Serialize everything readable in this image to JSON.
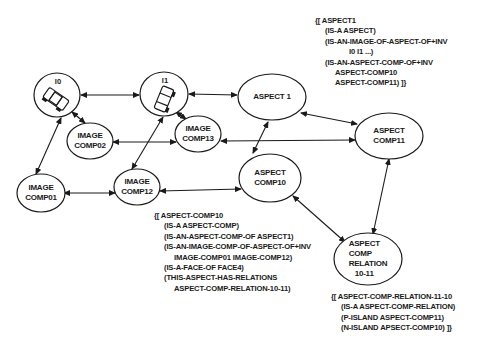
{
  "nodes": {
    "i0": {
      "label": "I0",
      "icon": "car-icon"
    },
    "i1": {
      "label": "I1",
      "icon": "car-icon"
    },
    "image_comp02": {
      "line1": "IMAGE",
      "line2": "COMP02"
    },
    "image_comp13": {
      "line1": "IMAGE",
      "line2": "COMP13"
    },
    "aspect1": {
      "label": "ASPECT 1"
    },
    "aspect_comp11": {
      "line1": "ASPECT",
      "line2": "COMP11"
    },
    "image_comp01": {
      "line1": "IMAGE",
      "line2": "COMP01"
    },
    "image_comp12": {
      "line1": "IMAGE",
      "line2": "COMP12"
    },
    "aspect_comp10": {
      "line1": "ASPECT",
      "line2": "COMP10"
    },
    "aspect_comp_relation": {
      "line1": "ASPECT",
      "line2": "COMP",
      "line3": "RELATION",
      "line4": "10-11"
    }
  },
  "edges": [
    {
      "from": "I0",
      "to": "I1",
      "type": "bidirectional"
    },
    {
      "from": "I1",
      "to": "ASPECT 1",
      "type": "bidirectional"
    },
    {
      "from": "I0",
      "to": "IMAGE COMP02",
      "type": "bidirectional"
    },
    {
      "from": "I0",
      "to": "IMAGE COMP01",
      "type": "bidirectional"
    },
    {
      "from": "I1",
      "to": "IMAGE COMP13",
      "type": "bidirectional"
    },
    {
      "from": "I1",
      "to": "IMAGE COMP12",
      "type": "bidirectional"
    },
    {
      "from": "IMAGE COMP02",
      "to": "IMAGE COMP13",
      "type": "bidirectional"
    },
    {
      "from": "IMAGE COMP13",
      "to": "ASPECT COMP11",
      "type": "bidirectional"
    },
    {
      "from": "ASPECT 1",
      "to": "ASPECT COMP11",
      "type": "bidirectional"
    },
    {
      "from": "ASPECT 1",
      "to": "ASPECT COMP10",
      "type": "bidirectional"
    },
    {
      "from": "IMAGE COMP01",
      "to": "IMAGE COMP12",
      "type": "bidirectional"
    },
    {
      "from": "IMAGE COMP12",
      "to": "ASPECT COMP10",
      "type": "bidirectional"
    },
    {
      "from": "ASPECT COMP10",
      "to": "ASPECT COMP RELATION 10-11",
      "type": "bidirectional"
    },
    {
      "from": "ASPECT COMP11",
      "to": "ASPECT COMP RELATION 10-11",
      "type": "bidirectional"
    }
  ],
  "frames": {
    "aspect1": {
      "lines": [
        "{[ ASPECT1",
        "(IS-A ASPECT)",
        "(IS-AN-IMAGE-OF-ASPECT-OF+INV",
        "I0 I1 ...)",
        "(IS-AN-ASPECT-COMP-OF+INV",
        "ASPECT-COMP10",
        "ASPECT-COMP11) ]}"
      ]
    },
    "aspect_comp10": {
      "lines": [
        "{[ ASPECT-COMP10",
        "(IS-A ASPECT-COMP)",
        "(IS-AN-ASPECT-COMP-OF ASPECT1)",
        "(IS-AN-IMAGE-COMP-OF-ASPECT-OF+INV",
        "IMAGE-COMP01 IMAGE-COMP12)",
        "(IS-A-FACE-OF FACE4)",
        "(THIS-ASPECT-HAS-RELATIONS",
        "ASPECT-COMP-RELATION-10-11)"
      ]
    },
    "aspect_comp_relation": {
      "lines": [
        "{[ ASPECT-COMP-RELATION-11-10",
        "(IS-A ASPECT-COMP-RELATION)",
        "(P-ISLAND ASPECT-COMP11)",
        "(N-ISLAND APSECT-COMP10) ]}"
      ]
    }
  },
  "colors": {
    "stroke": "#1a1a1a",
    "background": "#ffffff"
  }
}
